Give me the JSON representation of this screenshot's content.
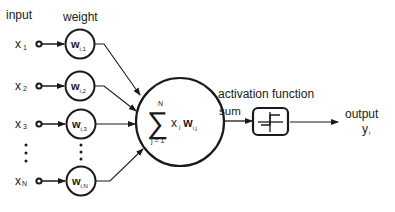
{
  "diagram": {
    "type": "artificial-neuron",
    "headers": {
      "input": "input",
      "weight": "weight"
    },
    "inputs": [
      {
        "name": "x",
        "sub": "1",
        "weight": "w",
        "weight_sub": "i,1"
      },
      {
        "name": "x",
        "sub": "2",
        "weight": "w",
        "weight_sub": "i,2"
      },
      {
        "name": "x",
        "sub": "3",
        "weight": "w",
        "weight_sub": "i,3"
      },
      {
        "name": "x",
        "sub": "N",
        "weight": "w",
        "weight_sub": "i,N"
      }
    ],
    "summation": {
      "symbol": "∑",
      "upper": "N",
      "lower": "j = 1",
      "term_x": "x",
      "term_x_sub": "j",
      "term_w": "w",
      "term_w_sub": "i,j"
    },
    "sum_label": "sum",
    "activation_label": "activation function",
    "output": {
      "label": "output",
      "symbol": "y",
      "sub": "i"
    },
    "colors": {
      "stroke": "#1a1a1a",
      "background": "#ffffff"
    }
  }
}
